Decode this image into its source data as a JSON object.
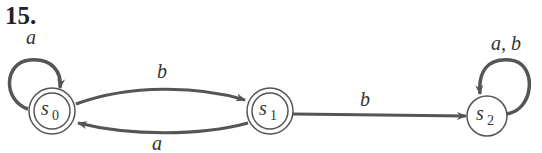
{
  "problem_number": "15.",
  "states": [
    {
      "id": "s0",
      "name": "s",
      "sub": "0",
      "accepting": true,
      "cx": 52,
      "cy": 111
    },
    {
      "id": "s1",
      "name": "s",
      "sub": "1",
      "accepting": true,
      "cx": 270,
      "cy": 111
    },
    {
      "id": "s2",
      "name": "s",
      "sub": "2",
      "accepting": false,
      "cx": 487,
      "cy": 116
    }
  ],
  "transitions": [
    {
      "from": "s0",
      "to": "s0",
      "label": "a"
    },
    {
      "from": "s0",
      "to": "s1",
      "label": "b"
    },
    {
      "from": "s1",
      "to": "s0",
      "label": "a"
    },
    {
      "from": "s1",
      "to": "s2",
      "label": "b"
    },
    {
      "from": "s2",
      "to": "s2",
      "label": "a, b"
    }
  ],
  "colors": {
    "stroke": "#555555",
    "text": "#333333"
  }
}
